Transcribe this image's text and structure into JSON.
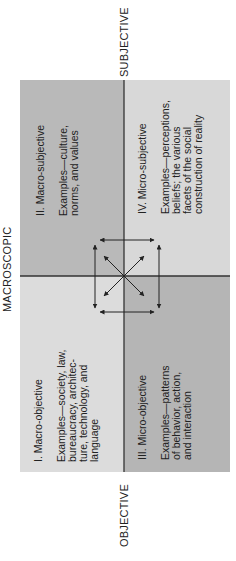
{
  "axes": {
    "top": "MACROSCOPIC",
    "left": "OBJECTIVE",
    "right": "SUBJECTIVE"
  },
  "quadrants": [
    {
      "id": "I",
      "title": "I. Macro-objective",
      "examples": "Examples—society, law,\nbureaucracy, architec-\nture, technology, and\nlanguage",
      "color": "#dcdcdc"
    },
    {
      "id": "II",
      "title": "II. Macro-subjective",
      "examples": "Examples—culture,\nnorms, and values",
      "color": "#b9b9b9"
    },
    {
      "id": "III",
      "title": "III. Micro-objective",
      "examples": "Examples—patterns\nof behavior, action,\nand interaction",
      "color": "#b5b5b5"
    },
    {
      "id": "IV",
      "title": "IV. Micro-subjective",
      "examples": "Examples—perceptions,\nbeliefs; the various\nfacets of the social\nconstruction of reality",
      "color": "#d8d8d8"
    }
  ],
  "orientation": "rotated -90 degrees"
}
